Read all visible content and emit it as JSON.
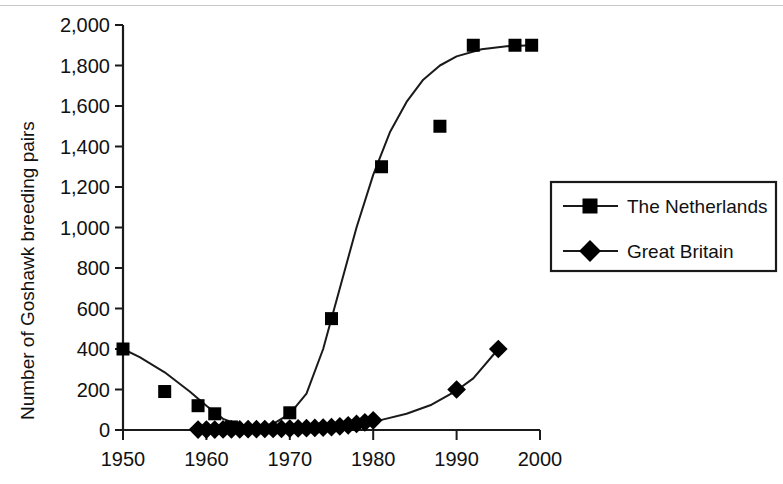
{
  "chart_data": {
    "type": "scatter",
    "title": "",
    "xlabel": "",
    "ylabel": "Number of Goshawk breeding pairs",
    "xlim": [
      1950,
      2000
    ],
    "ylim": [
      0,
      2000
    ],
    "xticks": [
      "1950",
      "1960",
      "1970",
      "1980",
      "1990",
      "2000"
    ],
    "xtick_values": [
      1950,
      1960,
      1970,
      1980,
      1990,
      2000
    ],
    "yticks": [
      "0",
      "200",
      "400",
      "600",
      "800",
      "1,000",
      "1,200",
      "1,400",
      "1,600",
      "1,800",
      "2,000"
    ],
    "ytick_values": [
      0,
      200,
      400,
      600,
      800,
      1000,
      1200,
      1400,
      1600,
      1800,
      2000
    ],
    "grid": false,
    "legend_position": "right",
    "series": [
      {
        "name": "The Netherlands",
        "marker": "square",
        "color": "#000000",
        "points": [
          [
            1950,
            400
          ],
          [
            1955,
            190
          ],
          [
            1959,
            120
          ],
          [
            1961,
            80
          ],
          [
            1963,
            15
          ],
          [
            1970,
            85
          ],
          [
            1975,
            550
          ],
          [
            1981,
            1300
          ],
          [
            1988,
            1500
          ],
          [
            1992,
            1900
          ],
          [
            1997,
            1900
          ],
          [
            1999,
            1900
          ]
        ],
        "fit_line": [
          [
            1950,
            400
          ],
          [
            1952,
            360
          ],
          [
            1955,
            285
          ],
          [
            1958,
            190
          ],
          [
            1960,
            120
          ],
          [
            1962,
            55
          ],
          [
            1964,
            25
          ],
          [
            1966,
            15
          ],
          [
            1968,
            30
          ],
          [
            1970,
            80
          ],
          [
            1972,
            180
          ],
          [
            1974,
            400
          ],
          [
            1976,
            700
          ],
          [
            1978,
            1000
          ],
          [
            1980,
            1260
          ],
          [
            1982,
            1470
          ],
          [
            1984,
            1620
          ],
          [
            1986,
            1730
          ],
          [
            1988,
            1800
          ],
          [
            1990,
            1845
          ],
          [
            1993,
            1880
          ],
          [
            1996,
            1895
          ],
          [
            1999,
            1900
          ]
        ]
      },
      {
        "name": "Great Britain",
        "marker": "diamond",
        "color": "#000000",
        "points": [
          [
            1959,
            2
          ],
          [
            1960,
            2
          ],
          [
            1961,
            2
          ],
          [
            1962,
            3
          ],
          [
            1963,
            3
          ],
          [
            1964,
            3
          ],
          [
            1965,
            4
          ],
          [
            1966,
            4
          ],
          [
            1967,
            5
          ],
          [
            1968,
            5
          ],
          [
            1969,
            6
          ],
          [
            1970,
            7
          ],
          [
            1971,
            8
          ],
          [
            1972,
            9
          ],
          [
            1973,
            10
          ],
          [
            1974,
            12
          ],
          [
            1975,
            14
          ],
          [
            1976,
            18
          ],
          [
            1977,
            23
          ],
          [
            1978,
            30
          ],
          [
            1979,
            38
          ],
          [
            1980,
            48
          ],
          [
            1990,
            200
          ],
          [
            1995,
            400
          ]
        ],
        "fit_line": [
          [
            1959,
            2
          ],
          [
            1963,
            3
          ],
          [
            1967,
            5
          ],
          [
            1970,
            7
          ],
          [
            1973,
            11
          ],
          [
            1976,
            18
          ],
          [
            1979,
            34
          ],
          [
            1981,
            50
          ],
          [
            1984,
            80
          ],
          [
            1987,
            125
          ],
          [
            1990,
            195
          ],
          [
            1992,
            255
          ],
          [
            1995,
            400
          ]
        ]
      }
    ]
  },
  "legend": {
    "items": [
      {
        "label": "The Netherlands",
        "marker": "square"
      },
      {
        "label": "Great Britain",
        "marker": "diamond"
      }
    ]
  }
}
